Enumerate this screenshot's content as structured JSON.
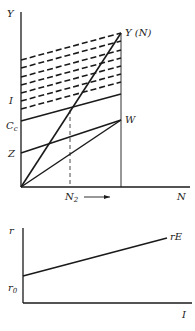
{
  "top_diagram": {
    "y_axis_label": "Y",
    "x_axis_label": "N",
    "curve_label": "Y (N)",
    "point_w_label": "W",
    "labels_on_y_axis": {
      "I": "I",
      "Cc": "C",
      "Cc_sub": "c",
      "Z": "Z"
    },
    "n2_label": "N",
    "n2_sub": "2",
    "arrow": "→"
  },
  "bottom_diagram": {
    "y_axis_label": "r",
    "x_axis_label": "I",
    "line_label": "rE",
    "intercept_label": "r",
    "intercept_sub": "0"
  },
  "colors": {
    "ink": "#1a1a1a",
    "background": "#ffffff"
  }
}
